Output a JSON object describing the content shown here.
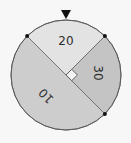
{
  "spinner": {
    "center": [
      66,
      75
    ],
    "radius": 55,
    "pointer_color": "#111111",
    "outline_color": "#555555",
    "sectors": [
      {
        "label": "20",
        "value": 20,
        "start_deg": 45,
        "end_deg": 135,
        "fraction": "1/4",
        "color": "#e3e3e3"
      },
      {
        "label": "30",
        "value": 30,
        "start_deg": -45,
        "end_deg": 45,
        "fraction": "1/4",
        "color": "#c4c4c4"
      },
      {
        "label": "10",
        "value": 10,
        "start_deg": 135,
        "end_deg": 315,
        "fraction": "1/2",
        "color": "#cdcdcd"
      }
    ],
    "right_angle_marker": true,
    "boundary_dots": 3
  }
}
